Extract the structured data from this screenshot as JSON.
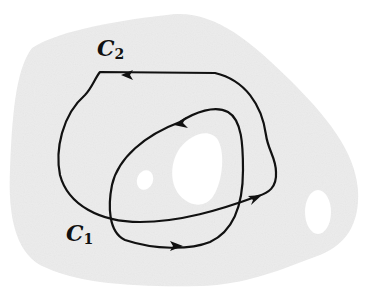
{
  "diagram": {
    "region": {
      "fill": "#ececec",
      "hole_count": 3
    },
    "curves": [
      {
        "name": "C",
        "subscript": "2",
        "stroke": "#111111",
        "arrow_count": 2
      },
      {
        "name": "C",
        "subscript": "1",
        "stroke": "#111111",
        "arrow_count": 2
      }
    ],
    "labels": {
      "c2": {
        "main": "C",
        "sub": "2"
      },
      "c1": {
        "main": "C",
        "sub": "1"
      }
    }
  }
}
